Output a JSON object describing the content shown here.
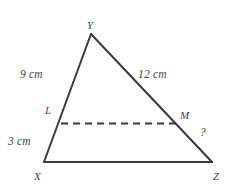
{
  "figure": {
    "type": "geometry-diagram",
    "shape": "triangle",
    "background_color": "#ffffff",
    "stroke_color": "#3a3a3e",
    "text_color": "#46464a"
  },
  "vertices": {
    "apex": {
      "name": "Y",
      "x": 91,
      "y": 34
    },
    "bottom_left": {
      "name": "X",
      "x": 44,
      "y": 162
    },
    "bottom_right": {
      "name": "Z",
      "x": 212,
      "y": 162
    }
  },
  "points": {
    "on_left_side": {
      "name": "L",
      "x": 61,
      "y": 123
    },
    "on_right_side": {
      "name": "M",
      "x": 175,
      "y": 124
    }
  },
  "labels": {
    "apex": "Y",
    "bottom_left": "X",
    "bottom_right": "Z",
    "left_point": "L",
    "right_point": "M",
    "side_yl": "9 cm",
    "side_ym": "12 cm",
    "side_lx": "3 cm",
    "side_mz": "?"
  },
  "measurements": [
    {
      "segment": "YL",
      "value": "9 cm",
      "number": 9,
      "unit": "cm"
    },
    {
      "segment": "YM",
      "value": "12 cm",
      "number": 12,
      "unit": "cm"
    },
    {
      "segment": "LX",
      "value": "3 cm",
      "number": 3,
      "unit": "cm"
    },
    {
      "segment": "MZ",
      "value": "?",
      "number": null,
      "unit": "cm"
    }
  ],
  "segments": {
    "solid": [
      {
        "name": "YX",
        "from": "Y",
        "to": "X"
      },
      {
        "name": "YZ",
        "from": "Y",
        "to": "Z"
      },
      {
        "name": "XZ",
        "from": "X",
        "to": "Z"
      }
    ],
    "dashed": [
      {
        "name": "LM",
        "from": "L",
        "to": "M"
      }
    ]
  }
}
